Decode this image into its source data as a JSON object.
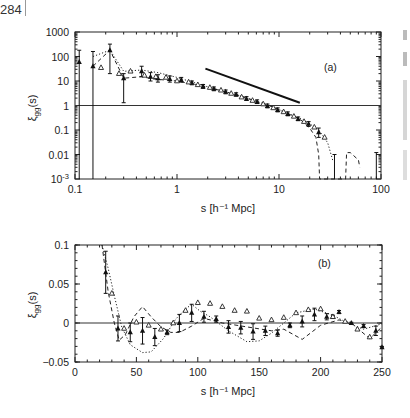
{
  "page": {
    "page_number": "284"
  },
  "chart_data": [
    {
      "type": "scatter",
      "panel_label": "(a)",
      "xlabel": "s [h⁻¹ Mpc]",
      "ylabel": "ξ_gg(s)",
      "xscale": "log",
      "yscale": "log",
      "xlim": [
        0.1,
        100
      ],
      "ylim": [
        0.001,
        1000
      ],
      "x_ticks": [
        "0.1",
        "1",
        "10",
        "100"
      ],
      "y_ticks": [
        "1000",
        "100",
        "10",
        "1",
        "0.1",
        "0.01",
        "10⁻³"
      ],
      "reference_line": {
        "y": 1,
        "style": "solid"
      },
      "power_law_line": {
        "x": [
          1.9,
          16
        ],
        "y": [
          32,
          1.3
        ],
        "style": "solid thick"
      },
      "series": [
        {
          "name": "filled triangles (with error bars)",
          "marker": "filled-triangle",
          "x": [
            0.11,
            0.15,
            0.22,
            0.3,
            0.45,
            0.55,
            0.65,
            0.85,
            1.1,
            1.4,
            1.8,
            2.3,
            3.0,
            3.8,
            4.8,
            6.1,
            7.7,
            9.7,
            12.2,
            15.4,
            19.5,
            24.5
          ],
          "y": [
            60,
            40,
            180,
            13,
            25,
            15,
            13,
            12,
            11,
            8.5,
            6,
            4.8,
            3.6,
            2.8,
            1.9,
            1.4,
            0.95,
            0.65,
            0.45,
            0.28,
            0.18,
            0.08
          ],
          "yerr_low": [
            0.001,
            0.001,
            20,
            1.3,
            15,
            10,
            9,
            9,
            9,
            7,
            5,
            4,
            3,
            2.4,
            1.6,
            1.2,
            0.8,
            0.55,
            0.38,
            0.24,
            0.14,
            0.05
          ],
          "yerr_high": [
            180,
            160,
            320,
            20,
            40,
            22,
            18,
            16,
            14,
            10,
            7.2,
            5.7,
            4.3,
            3.3,
            2.3,
            1.7,
            1.15,
            0.8,
            0.55,
            0.34,
            0.22,
            0.12
          ]
        },
        {
          "name": "open triangles",
          "marker": "open-triangle",
          "x": [
            0.18,
            0.27,
            0.35,
            0.48,
            0.62,
            0.78,
            1.0,
            1.3,
            1.6,
            2.1,
            2.7,
            3.4,
            4.3,
            5.5,
            7.0,
            8.8,
            11.1,
            14,
            17.6,
            22.2,
            28
          ],
          "y": [
            35,
            20,
            25,
            17,
            15,
            14,
            10,
            9,
            7,
            5.4,
            4.2,
            3.1,
            2.2,
            1.6,
            1.15,
            0.8,
            0.55,
            0.36,
            0.22,
            0.13,
            0.05
          ]
        },
        {
          "name": "dashed model",
          "style": "dashed",
          "x": [
            0.15,
            0.22,
            0.3,
            0.45,
            0.6,
            1.0,
            2.0,
            4.0,
            8.0,
            12,
            16,
            20,
            23,
            24.5,
            25,
            45,
            46,
            50,
            60,
            62
          ],
          "y": [
            40,
            180,
            13,
            15,
            12,
            10,
            5.6,
            2.6,
            1.0,
            0.48,
            0.28,
            0.12,
            0.05,
            0.01,
            0.001,
            0.001,
            0.012,
            0.012,
            0.006,
            0.003
          ]
        },
        {
          "name": "dotted model",
          "style": "dotted",
          "x": [
            0.15,
            0.22,
            0.3,
            0.45,
            0.65,
            1.0,
            2.0,
            4.0,
            8.0,
            12,
            16,
            20,
            25,
            30,
            34
          ],
          "y": [
            100,
            180,
            25,
            28,
            22,
            14,
            5.8,
            2.6,
            1.0,
            0.5,
            0.3,
            0.18,
            0.09,
            0.03,
            0.005
          ]
        }
      ]
    },
    {
      "type": "scatter",
      "panel_label": "(b)",
      "xlabel": "s [h⁻¹ Mpc]",
      "ylabel": "ξ_gg(s)",
      "xscale": "linear",
      "yscale": "linear",
      "xlim": [
        0,
        250
      ],
      "ylim": [
        -0.05,
        0.1
      ],
      "x_ticks": [
        "0",
        "50",
        "100",
        "150",
        "200",
        "250"
      ],
      "y_ticks": [
        "0.1",
        "0.05",
        "0",
        "−0.05"
      ],
      "reference_line": {
        "y": 0,
        "style": "solid"
      },
      "series": [
        {
          "name": "filled triangles (with error bars)",
          "marker": "filled-triangle",
          "x": [
            25,
            35,
            45,
            55,
            65,
            75,
            85,
            95,
            105,
            115,
            125,
            135,
            145,
            155,
            165,
            175,
            185,
            195,
            205,
            210,
            215,
            225,
            235,
            245,
            250
          ],
          "y": [
            0.065,
            -0.007,
            -0.012,
            -0.01,
            -0.018,
            -0.012,
            0.0,
            0.013,
            0.008,
            0.005,
            -0.005,
            -0.006,
            -0.011,
            -0.01,
            -0.013,
            -0.003,
            0.002,
            0.011,
            0.008,
            0.008,
            0.014,
            0.0,
            -0.004,
            -0.01,
            -0.031
          ],
          "yerr": [
            0.027,
            0.016,
            0.012,
            0.017,
            0.011,
            0.003,
            0.011,
            0.011,
            0.007,
            0.004,
            0.008,
            0.008,
            0.01,
            0.006,
            0.004,
            0.003,
            0.007,
            0.008,
            0.004,
            0.002,
            0.002,
            0.001,
            0.002,
            0.006,
            0.001
          ]
        },
        {
          "name": "open triangles",
          "marker": "open-triangle",
          "x": [
            30,
            40,
            50,
            60,
            70,
            80,
            90,
            100,
            110,
            120,
            130,
            140,
            150,
            160,
            170,
            180,
            190,
            200,
            210,
            220,
            230,
            240
          ],
          "y": [
            0.038,
            -0.007,
            0.001,
            -0.003,
            -0.008,
            0.0,
            0.016,
            0.026,
            0.025,
            0.021,
            0.016,
            0.015,
            0.006,
            0.004,
            0.007,
            0.013,
            0.017,
            0.018,
            0.008,
            0.002,
            -0.008,
            -0.018
          ]
        },
        {
          "name": "dashed model",
          "style": "dashed",
          "x": [
            22,
            27,
            32,
            36,
            41,
            48,
            55,
            62,
            70,
            78,
            85,
            95,
            105,
            120,
            140,
            160,
            170,
            185,
            200,
            215,
            225,
            240,
            250
          ],
          "y": [
            0.1,
            0.04,
            0.0,
            -0.022,
            -0.015,
            0.008,
            0.021,
            0.008,
            -0.005,
            -0.012,
            -0.012,
            -0.004,
            0.006,
            0.0,
            -0.005,
            -0.01,
            -0.008,
            -0.021,
            -0.003,
            0.004,
            0.0,
            -0.02,
            -0.005
          ]
        },
        {
          "name": "dotted model",
          "style": "dotted",
          "x": [
            22,
            27,
            32,
            38,
            45,
            55,
            62,
            72,
            82,
            90,
            95,
            102,
            110,
            125,
            140,
            150,
            160,
            170,
            180,
            195,
            210,
            222,
            235,
            250
          ],
          "y": [
            0.1,
            0.07,
            0.035,
            -0.005,
            -0.028,
            -0.038,
            -0.037,
            -0.02,
            0.005,
            0.018,
            0.024,
            0.015,
            0.008,
            -0.01,
            -0.024,
            -0.023,
            -0.013,
            0.0,
            0.013,
            0.018,
            0.01,
            0.0,
            -0.008,
            -0.001
          ]
        }
      ]
    }
  ]
}
